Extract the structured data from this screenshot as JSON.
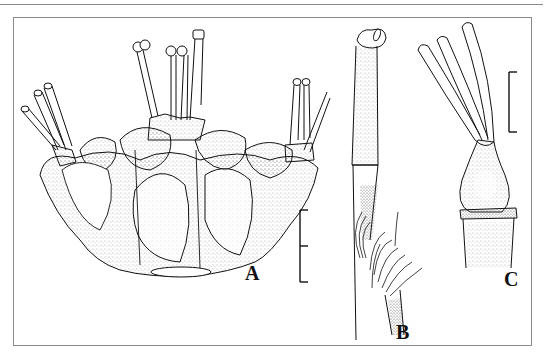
{
  "figure": {
    "panels": [
      {
        "id": "A",
        "label": "A",
        "description": "whole flower, lateral view"
      },
      {
        "id": "B",
        "label": "B",
        "description": "stamen with hairs"
      },
      {
        "id": "C",
        "label": "C",
        "description": "gynoecium with style branches"
      }
    ],
    "scale_bars": [
      {
        "panel": "A",
        "ticks": 3
      },
      {
        "panel": "C",
        "ticks": 2
      }
    ],
    "colors": {
      "ink": "#111111",
      "frame": "#8a8a8a",
      "stipple": "#555555",
      "background": "#ffffff"
    }
  }
}
